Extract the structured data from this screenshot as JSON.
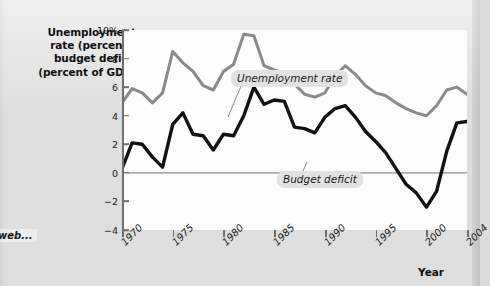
{
  "margin_note": "web...",
  "axis_title_lines": [
    "Unemployment",
    "rate (percent),",
    "budget deficit",
    "(percent of GDP)"
  ],
  "x_axis_label": "Year",
  "callouts": {
    "unemployment": "Unemployment rate",
    "budget_deficit": "Budget deficit"
  },
  "colors": {
    "unemployment_line": "#8a8a8a",
    "deficit_line": "#111111",
    "zero_line": "#8c8c8c",
    "axis": "#6f6f6f",
    "plot_background": "#fdfdfd",
    "page_background": "#dedede",
    "callout_background": "#e2e2e2"
  },
  "chart_data": {
    "type": "line",
    "title": "",
    "xlabel": "Year",
    "ylabel": "Unemployment rate (percent), budget deficit (percent of GDP)",
    "xlim": [
      1970,
      2004
    ],
    "ylim": [
      -4,
      10
    ],
    "grid": false,
    "legend_position": "inline-callout",
    "x_tick_labels": [
      "1970",
      "1975",
      "1980",
      "1985",
      "1990",
      "1995",
      "2000",
      "2004"
    ],
    "x_ticks": [
      1970,
      1975,
      1980,
      1985,
      1990,
      1995,
      2000,
      2004
    ],
    "y_tick_labels": [
      "10%",
      "8",
      "6",
      "4",
      "2",
      "0",
      "−2",
      "−4"
    ],
    "y_ticks": [
      10,
      8,
      6,
      4,
      2,
      0,
      -2,
      -4
    ],
    "zero_reference_line": 0,
    "x": [
      1970,
      1971,
      1972,
      1973,
      1974,
      1975,
      1976,
      1977,
      1978,
      1979,
      1980,
      1981,
      1982,
      1983,
      1984,
      1985,
      1986,
      1987,
      1988,
      1989,
      1990,
      1991,
      1992,
      1993,
      1994,
      1995,
      1996,
      1997,
      1998,
      1999,
      2000,
      2001,
      2002,
      2003,
      2004
    ],
    "series": [
      {
        "name": "Unemployment rate",
        "color": "#8a8a8a",
        "values": [
          4.9,
          5.9,
          5.6,
          4.9,
          5.6,
          8.5,
          7.7,
          7.1,
          6.1,
          5.8,
          7.1,
          7.6,
          9.7,
          9.6,
          7.5,
          7.2,
          7.0,
          6.2,
          5.5,
          5.3,
          5.6,
          6.8,
          7.5,
          6.9,
          6.1,
          5.6,
          5.4,
          4.9,
          4.5,
          4.2,
          4.0,
          4.7,
          5.8,
          6.0,
          5.5
        ]
      },
      {
        "name": "Budget deficit",
        "color": "#111111",
        "values": [
          0.3,
          2.1,
          2.0,
          1.1,
          0.4,
          3.4,
          4.2,
          2.7,
          2.6,
          1.6,
          2.7,
          2.6,
          4.0,
          6.0,
          4.8,
          5.1,
          5.0,
          3.2,
          3.1,
          2.8,
          3.9,
          4.5,
          4.7,
          3.9,
          2.9,
          2.2,
          1.4,
          0.3,
          -0.8,
          -1.4,
          -2.4,
          -1.3,
          1.5,
          3.5,
          3.6
        ]
      }
    ]
  }
}
